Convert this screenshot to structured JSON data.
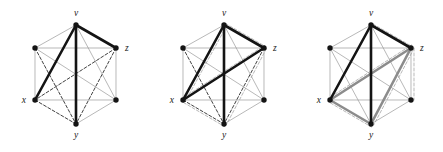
{
  "figure": {
    "title": "",
    "background": "#ffffff",
    "panel_count": 3,
    "label_color": "#1a1a1a"
  },
  "chart_data": {
    "type": "diagram",
    "title": "",
    "subtitle": "",
    "xlabel": "",
    "ylabel": "",
    "layout": "hexagon",
    "vertices": [
      {
        "id": "v",
        "label": "v",
        "x": 76,
        "y": 25,
        "label_dx": 0,
        "label_dy": -9,
        "label_anchor": "middle"
      },
      {
        "id": "ul",
        "label": "",
        "x": 35,
        "y": 48,
        "label_dx": 0,
        "label_dy": 0,
        "label_anchor": "middle"
      },
      {
        "id": "z",
        "label": "z",
        "x": 116,
        "y": 48,
        "label_dx": 9,
        "label_dy": 3,
        "label_anchor": "start"
      },
      {
        "id": "x",
        "label": "x",
        "x": 35,
        "y": 100,
        "label_dx": -9,
        "label_dy": 3,
        "label_anchor": "end"
      },
      {
        "id": "lr",
        "label": "",
        "x": 116,
        "y": 100,
        "label_dx": 0,
        "label_dy": 0,
        "label_anchor": "middle"
      },
      {
        "id": "y",
        "label": "y",
        "x": 76,
        "y": 124,
        "label_dx": 0,
        "label_dy": 14,
        "label_anchor": "middle"
      }
    ],
    "styles": {
      "thin_gray": {
        "color": "#9a9a9a",
        "width": 0.7,
        "dash": "none"
      },
      "dashed_dark": {
        "color": "#2b2b2b",
        "width": 0.9,
        "dash": "3,2"
      },
      "dashed_light": {
        "color": "#b8b8b8",
        "width": 1.0,
        "dash": "3,2"
      },
      "bold_black": {
        "color": "#141414",
        "width": 2.6,
        "dash": "none"
      },
      "bold_gray": {
        "color": "#8c8c8c",
        "width": 2.6,
        "dash": "none"
      },
      "vertex_fill": "#141414",
      "vertex_radius": 2.7
    },
    "panels": [
      {
        "name": "panel-1",
        "caption": "",
        "edges": [
          {
            "from": "v",
            "to": "ul",
            "style": "thin_gray"
          },
          {
            "from": "v",
            "to": "z",
            "style": "bold_black"
          },
          {
            "from": "v",
            "to": "x",
            "style": "bold_black"
          },
          {
            "from": "v",
            "to": "y",
            "style": "bold_black"
          },
          {
            "from": "v",
            "to": "lr",
            "style": "thin_gray"
          },
          {
            "from": "ul",
            "to": "z",
            "style": "thin_gray"
          },
          {
            "from": "ul",
            "to": "x",
            "style": "thin_gray"
          },
          {
            "from": "ul",
            "to": "lr",
            "style": "thin_gray"
          },
          {
            "from": "ul",
            "to": "y",
            "style": "dashed_dark"
          },
          {
            "from": "z",
            "to": "x",
            "style": "dashed_dark"
          },
          {
            "from": "z",
            "to": "lr",
            "style": "thin_gray"
          },
          {
            "from": "z",
            "to": "y",
            "style": "dashed_dark"
          },
          {
            "from": "x",
            "to": "lr",
            "style": "thin_gray"
          },
          {
            "from": "x",
            "to": "y",
            "style": "dashed_dark"
          },
          {
            "from": "lr",
            "to": "y",
            "style": "thin_gray"
          }
        ]
      },
      {
        "name": "panel-2",
        "caption": "",
        "edges": [
          {
            "from": "v",
            "to": "ul",
            "style": "thin_gray"
          },
          {
            "from": "v",
            "to": "z",
            "style": "bold_black"
          },
          {
            "from": "v",
            "to": "x",
            "style": "bold_black"
          },
          {
            "from": "v",
            "to": "y",
            "style": "bold_black"
          },
          {
            "from": "v",
            "to": "lr",
            "style": "thin_gray"
          },
          {
            "from": "ul",
            "to": "z",
            "style": "thin_gray"
          },
          {
            "from": "ul",
            "to": "x",
            "style": "thin_gray"
          },
          {
            "from": "ul",
            "to": "lr",
            "style": "thin_gray"
          },
          {
            "from": "ul",
            "to": "y",
            "style": "dashed_dark"
          },
          {
            "from": "z",
            "to": "x",
            "style": "bold_black"
          },
          {
            "from": "z",
            "to": "lr",
            "style": "thin_gray"
          },
          {
            "from": "z",
            "to": "y",
            "style": "dashed_dark"
          },
          {
            "from": "x",
            "to": "lr",
            "style": "thin_gray"
          },
          {
            "from": "x",
            "to": "y",
            "style": "dashed_dark"
          },
          {
            "from": "lr",
            "to": "y",
            "style": "thin_gray"
          }
        ],
        "ghost_edges": [
          {
            "from": "v",
            "to": "z",
            "style": "dashed_light",
            "dx": 1.5,
            "dy": -1.5
          },
          {
            "from": "v",
            "to": "x",
            "style": "dashed_light",
            "dx": 2.5,
            "dy": 1.0
          },
          {
            "from": "x",
            "to": "z",
            "style": "dashed_light",
            "dx": 0.5,
            "dy": -2.5
          },
          {
            "from": "x",
            "to": "y",
            "style": "dashed_light",
            "dx": 0.5,
            "dy": 2.5
          },
          {
            "from": "z",
            "to": "y",
            "style": "dashed_light",
            "dx": 2.5,
            "dy": 0.5
          }
        ]
      },
      {
        "name": "panel-3",
        "caption": "",
        "edges": [
          {
            "from": "v",
            "to": "ul",
            "style": "thin_gray"
          },
          {
            "from": "v",
            "to": "z",
            "style": "bold_black"
          },
          {
            "from": "v",
            "to": "x",
            "style": "bold_black"
          },
          {
            "from": "v",
            "to": "y",
            "style": "bold_black"
          },
          {
            "from": "v",
            "to": "lr",
            "style": "thin_gray"
          },
          {
            "from": "ul",
            "to": "z",
            "style": "thin_gray"
          },
          {
            "from": "ul",
            "to": "x",
            "style": "thin_gray"
          },
          {
            "from": "ul",
            "to": "lr",
            "style": "thin_gray"
          },
          {
            "from": "ul",
            "to": "y",
            "style": "thin_gray"
          },
          {
            "from": "z",
            "to": "x",
            "style": "bold_gray"
          },
          {
            "from": "z",
            "to": "lr",
            "style": "thin_gray"
          },
          {
            "from": "z",
            "to": "y",
            "style": "bold_gray"
          },
          {
            "from": "x",
            "to": "lr",
            "style": "thin_gray"
          },
          {
            "from": "x",
            "to": "y",
            "style": "bold_gray"
          },
          {
            "from": "lr",
            "to": "y",
            "style": "thin_gray"
          }
        ],
        "ghost_edges": [
          {
            "from": "v",
            "to": "z",
            "style": "dashed_light",
            "dx": 2.0,
            "dy": -1.0
          },
          {
            "from": "x",
            "to": "z",
            "style": "dashed_light",
            "dx": 0.5,
            "dy": -3.0
          },
          {
            "from": "x",
            "to": "y",
            "style": "dashed_light",
            "dx": 0.5,
            "dy": 3.0
          },
          {
            "from": "z",
            "to": "y",
            "style": "dashed_light",
            "dx": 3.0,
            "dy": 0.5
          },
          {
            "from": "z",
            "to": "lr",
            "style": "dashed_light",
            "dx": 3.0,
            "dy": 0.0
          }
        ]
      }
    ]
  }
}
